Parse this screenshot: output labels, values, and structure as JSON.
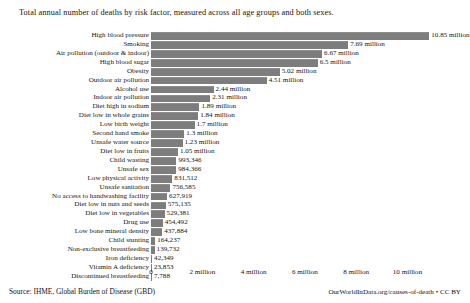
{
  "chart_data": {
    "type": "bar",
    "orientation": "horizontal",
    "title": "Total annual number of deaths by risk factor, measured across all age groups and both sexes.",
    "xlabel": "",
    "ylabel": "",
    "xlim": [
      0,
      11200000
    ],
    "grid": false,
    "legend": null,
    "xticks": [
      {
        "value": 0,
        "label": "0"
      },
      {
        "value": 2000000,
        "label": "2 million"
      },
      {
        "value": 4000000,
        "label": "4 million"
      },
      {
        "value": 6000000,
        "label": "6 million"
      },
      {
        "value": 8000000,
        "label": "8 million"
      },
      {
        "value": 10000000,
        "label": "10 million"
      }
    ],
    "bar_color": "#7d7d7d",
    "categories": [
      "High blood pressure",
      "Smoking",
      "Air pollution (outdoor & indoor)",
      "High blood sugar",
      "Obesity",
      "Outdoor air pollution",
      "Alcohol use",
      "Indoor air pollution",
      "Diet high in sodium",
      "Diet low in whole grains",
      "Low birth weight",
      "Second hand smoke",
      "Unsafe water source",
      "Diet low in fruits",
      "Child wasting",
      "Unsafe sex",
      "Low physical activity",
      "Unsafe sanitation",
      "No access to handwashing facility",
      "Diet low in nuts and seeds",
      "Diet low in vegetables",
      "Drug use",
      "Low bone mineral density",
      "Child stunting",
      "Non-exclusive breastfeeding",
      "Iron deficiency",
      "Vitamin A deficiency",
      "Discontinued breastfeeding"
    ],
    "values": [
      10850000,
      7690000,
      6670000,
      6500000,
      5020000,
      4510000,
      2440000,
      2310000,
      1890000,
      1840000,
      1700000,
      1300000,
      1230000,
      1050000,
      993346,
      984366,
      831512,
      756585,
      627919,
      575135,
      529381,
      454492,
      437884,
      164237,
      139732,
      42349,
      23853,
      7788
    ],
    "value_labels": [
      "10.85 million",
      "7.69 million",
      "6.67 million",
      "6.5 million",
      "5.02 million",
      "4.51 million",
      "2.44 million",
      "2.31 million",
      "1.89 million",
      "1.84 million",
      "1.7 million",
      "1.3 million",
      "1.23 million",
      "1.05 million",
      "993,346",
      "984,366",
      "831,512",
      "756,585",
      "627,919",
      "575,135",
      "529,381",
      "454,492",
      "437,884",
      "164,237",
      "139,732",
      "42,349",
      "23,853",
      "7,788"
    ]
  },
  "footer": {
    "source": "Source: IHME, Global Burden of Disease (GBD)",
    "attribution": "OurWorldInData.org/causes-of-death • CC BY"
  }
}
